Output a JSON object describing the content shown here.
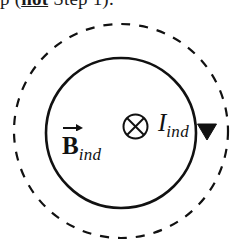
{
  "caption": {
    "text_before": "p (",
    "emphasis": "not",
    "text_after": " Step 1)."
  },
  "figure": {
    "name": "induced-magnetic-field-and-current-loop",
    "background_color": "#ffffff",
    "stroke_color": "#111111",
    "labels": {
      "b_field": {
        "symbol": "B",
        "subscript": "ind",
        "vector_arrow": "right-arrow-overbar",
        "full_text": "B_ind"
      },
      "current": {
        "symbol": "I",
        "subscript": "ind",
        "full_text": "I_ind"
      },
      "into_page_symbol": "circle-with-cross"
    },
    "outer_loop": {
      "name": "dashed-field-boundary-circle",
      "style": "dashed",
      "center_x": 121,
      "center_y": 131,
      "radius": 107,
      "stroke_width": 2.2,
      "dash_pattern": "9 9"
    },
    "inner_loop": {
      "name": "solid-current-loop-circle",
      "style": "solid",
      "center_x": 121,
      "center_y": 133,
      "radius": 75,
      "stroke_width": 2.6
    },
    "current_direction": {
      "name": "clockwise-arrowhead",
      "direction": "clockwise",
      "marker": "filled-triangle",
      "position_x": 207,
      "position_y": 131
    }
  }
}
